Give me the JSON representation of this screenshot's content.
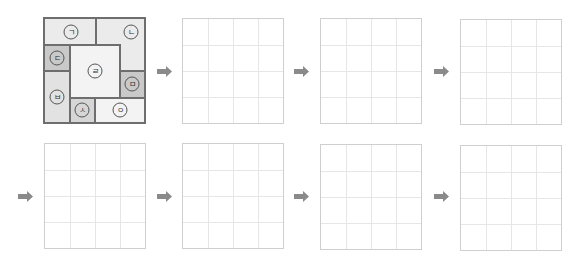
{
  "puzzle": {
    "grid_size": 4,
    "pieces": [
      {
        "id": "giyeok",
        "label": "ㄱ",
        "cells": [
          [
            0,
            0
          ],
          [
            0,
            1
          ]
        ],
        "color": "#ebebeb"
      },
      {
        "id": "nieun",
        "label": "ㄴ",
        "cells": [
          [
            0,
            2
          ],
          [
            0,
            3
          ],
          [
            1,
            3
          ]
        ],
        "color": "#ebebeb"
      },
      {
        "id": "digeut",
        "label": "ㄷ",
        "cells": [
          [
            1,
            0
          ]
        ],
        "color": "#c9c9c9"
      },
      {
        "id": "rieul",
        "label": "ㄹ",
        "cells": [
          [
            1,
            1
          ],
          [
            1,
            2
          ],
          [
            2,
            1
          ],
          [
            2,
            2
          ]
        ],
        "color": "#f3f3f3"
      },
      {
        "id": "mieum",
        "label": "ㅁ",
        "cells": [
          [
            2,
            3
          ]
        ],
        "color": "#c9c9c9"
      },
      {
        "id": "bieup",
        "label": "ㅂ",
        "cells": [
          [
            2,
            0
          ],
          [
            3,
            0
          ]
        ],
        "color": "#e2e2e2"
      },
      {
        "id": "siot",
        "label": "ㅅ",
        "cells": [
          [
            3,
            1
          ]
        ],
        "color": "#d6d6d6"
      },
      {
        "id": "ieung",
        "label": "ㅇ",
        "cells": [
          [
            3,
            2
          ],
          [
            3,
            3
          ]
        ],
        "color": "#f3f3f3"
      }
    ]
  },
  "empty_grids": 7,
  "arrow": {
    "icon": "right-arrow-icon",
    "color": "#8a8a8a"
  }
}
